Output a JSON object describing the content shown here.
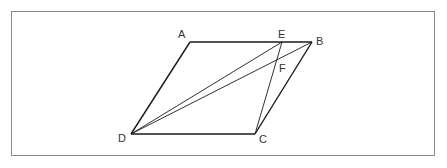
{
  "diagram": {
    "type": "geometry-parallelogram",
    "frame": {
      "x": 11,
      "y": 11,
      "width": 423,
      "height": 144,
      "color": "#8a8a8a"
    },
    "points": {
      "A": {
        "x": 190,
        "y": 42,
        "label": "A"
      },
      "B": {
        "x": 312,
        "y": 42,
        "label": "B"
      },
      "C": {
        "x": 255,
        "y": 134,
        "label": "C"
      },
      "D": {
        "x": 131,
        "y": 134,
        "label": "D"
      },
      "E": {
        "x": 282,
        "y": 42,
        "label": "E"
      },
      "F": {
        "x": 277,
        "y": 60,
        "label": "F"
      }
    },
    "segments": [
      "AB",
      "BC",
      "CD",
      "DA",
      "DE",
      "DB",
      "EC"
    ],
    "line_color": "#1a1a1a"
  }
}
